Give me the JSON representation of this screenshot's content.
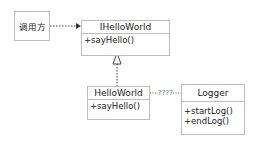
{
  "caller": {
    "label": "调用方"
  },
  "interface": {
    "name": "IHelloWorld",
    "methods": [
      "+sayHello()"
    ]
  },
  "impl": {
    "name": "HelloWorld",
    "methods": [
      "+sayHello()"
    ]
  },
  "logger": {
    "name": "Logger",
    "methods": [
      "+startLog()",
      "+endLog()"
    ]
  },
  "links": {
    "caller_to_interface": "dependency",
    "impl_to_interface": "realization",
    "impl_logger_label": "????"
  },
  "colors": {
    "border": "#bdbdbd",
    "line": "#444444",
    "text": "#222222"
  }
}
